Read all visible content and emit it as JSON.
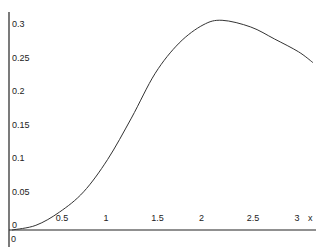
{
  "chart_data": {
    "type": "line",
    "title": "",
    "xlabel": "x",
    "ylabel": "",
    "xlim": [
      0,
      3.15
    ],
    "ylim": [
      0,
      0.32
    ],
    "grid": false,
    "legend": null,
    "x_ticks": [
      "0.5",
      "1",
      "1.5",
      "2",
      "2.5",
      "3"
    ],
    "y_ticks": [
      "0",
      "0.05",
      "0.1",
      "0.15",
      "0.2",
      "0.25",
      "0.3"
    ],
    "origin_label": "0",
    "series": [
      {
        "name": "f(x)",
        "x": [
          0,
          0.25,
          0.5,
          0.75,
          1.0,
          1.25,
          1.5,
          1.75,
          2.0,
          2.2,
          2.5,
          2.75,
          3.0,
          3.15
        ],
        "values": [
          0,
          0.007,
          0.027,
          0.057,
          0.105,
          0.167,
          0.234,
          0.279,
          0.306,
          0.313,
          0.303,
          0.285,
          0.266,
          0.25
        ]
      }
    ]
  }
}
